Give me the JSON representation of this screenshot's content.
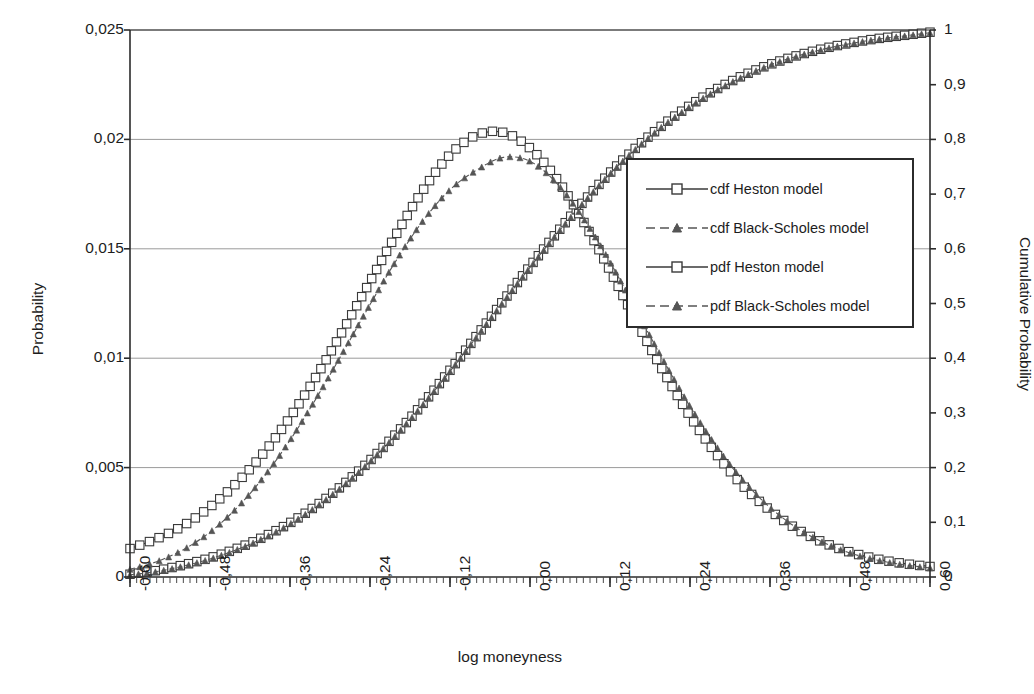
{
  "chart_data": {
    "type": "line",
    "title": "",
    "xlabel": "log moneyness",
    "ylabel": "Probability",
    "ylabel_secondary": "Cumulative Probability",
    "xlim": [
      -0.6,
      0.6
    ],
    "ylim": [
      0,
      0.025
    ],
    "ylim_secondary": [
      0,
      1
    ],
    "grid": true,
    "legend_position": "center-right",
    "x_tick_labels": [
      "-0,60",
      "-0,48",
      "-0,36",
      "-0,24",
      "-0,12",
      "0,00",
      "0,12",
      "0,24",
      "0,36",
      "0,48",
      "0,60"
    ],
    "x_tick_values": [
      -0.6,
      -0.48,
      -0.36,
      -0.24,
      -0.12,
      0.0,
      0.12,
      0.24,
      0.36,
      0.48,
      0.6
    ],
    "y_tick_labels": [
      "0",
      "0,005",
      "0,01",
      "0,015",
      "0,02",
      "0,025"
    ],
    "y_tick_values": [
      0,
      0.005,
      0.01,
      0.015,
      0.02,
      0.025
    ],
    "y2_tick_labels": [
      "0",
      "0,1",
      "0,2",
      "0,3",
      "0,4",
      "0,5",
      "0,6",
      "0,7",
      "0,8",
      "0,9",
      "1"
    ],
    "y2_tick_values": [
      0,
      0.1,
      0.2,
      0.3,
      0.4,
      0.5,
      0.6,
      0.7,
      0.8,
      0.9,
      1.0
    ],
    "series": [
      {
        "name": "cdf Heston model",
        "axis": "secondary",
        "marker": "square",
        "dash": false,
        "color": "#3a3a3a",
        "x": [
          -0.6,
          -0.56,
          -0.52,
          -0.48,
          -0.44,
          -0.4,
          -0.36,
          -0.32,
          -0.28,
          -0.24,
          -0.2,
          -0.16,
          -0.12,
          -0.08,
          -0.04,
          0.0,
          0.04,
          0.08,
          0.12,
          0.16,
          0.2,
          0.24,
          0.28,
          0.32,
          0.36,
          0.4,
          0.44,
          0.48,
          0.52,
          0.56,
          0.6
        ],
        "values": [
          0.005,
          0.012,
          0.022,
          0.035,
          0.052,
          0.073,
          0.099,
          0.131,
          0.169,
          0.213,
          0.263,
          0.318,
          0.378,
          0.441,
          0.505,
          0.568,
          0.629,
          0.686,
          0.739,
          0.786,
          0.827,
          0.862,
          0.892,
          0.917,
          0.937,
          0.953,
          0.966,
          0.976,
          0.984,
          0.99,
          0.996
        ]
      },
      {
        "name": "cdf Black-Scholes model",
        "axis": "secondary",
        "marker": "triangle",
        "dash": true,
        "color": "#555555",
        "x": [
          -0.6,
          -0.56,
          -0.52,
          -0.48,
          -0.44,
          -0.4,
          -0.36,
          -0.32,
          -0.28,
          -0.24,
          -0.2,
          -0.16,
          -0.12,
          -0.08,
          -0.04,
          0.0,
          0.04,
          0.08,
          0.12,
          0.16,
          0.2,
          0.24,
          0.28,
          0.32,
          0.36,
          0.4,
          0.44,
          0.48,
          0.52,
          0.56,
          0.6
        ],
        "values": [
          0.004,
          0.01,
          0.02,
          0.033,
          0.05,
          0.071,
          0.097,
          0.129,
          0.167,
          0.211,
          0.261,
          0.316,
          0.376,
          0.439,
          0.503,
          0.566,
          0.627,
          0.684,
          0.737,
          0.784,
          0.825,
          0.86,
          0.89,
          0.915,
          0.936,
          0.952,
          0.965,
          0.975,
          0.983,
          0.989,
          0.995
        ]
      },
      {
        "name": "pdf Heston model",
        "axis": "primary",
        "marker": "square",
        "dash": false,
        "color": "#3a3a3a",
        "x": [
          -0.6,
          -0.56,
          -0.52,
          -0.48,
          -0.44,
          -0.4,
          -0.36,
          -0.32,
          -0.28,
          -0.24,
          -0.2,
          -0.16,
          -0.12,
          -0.08,
          -0.04,
          0.0,
          0.04,
          0.08,
          0.12,
          0.16,
          0.2,
          0.24,
          0.28,
          0.32,
          0.36,
          0.4,
          0.44,
          0.48,
          0.52,
          0.56,
          0.6
        ],
        "values": [
          0.0013,
          0.00175,
          0.00235,
          0.0032,
          0.0043,
          0.00565,
          0.0073,
          0.0092,
          0.0113,
          0.0135,
          0.0157,
          0.0177,
          0.0193,
          0.0202,
          0.02032,
          0.0196,
          0.0182,
          0.01625,
          0.014,
          0.01165,
          0.0094,
          0.00735,
          0.0056,
          0.00415,
          0.00305,
          0.0022,
          0.00158,
          0.00114,
          0.00083,
          0.00062,
          0.00048
        ]
      },
      {
        "name": "pdf Black-Scholes model",
        "axis": "primary",
        "marker": "triangle",
        "dash": true,
        "color": "#555555",
        "x": [
          -0.6,
          -0.56,
          -0.52,
          -0.48,
          -0.44,
          -0.4,
          -0.36,
          -0.32,
          -0.28,
          -0.24,
          -0.2,
          -0.16,
          -0.12,
          -0.08,
          -0.04,
          0.0,
          0.04,
          0.08,
          0.12,
          0.16,
          0.2,
          0.24,
          0.28,
          0.32,
          0.36,
          0.4,
          0.44,
          0.48,
          0.52,
          0.56,
          0.6
        ],
        "values": [
          0.00035,
          0.0007,
          0.00125,
          0.00205,
          0.00315,
          0.00455,
          0.00625,
          0.0082,
          0.0103,
          0.01245,
          0.0145,
          0.0163,
          0.0177,
          0.0186,
          0.01918,
          0.019,
          0.018,
          0.0164,
          0.0144,
          0.01215,
          0.0099,
          0.0078,
          0.00595,
          0.0044,
          0.00318,
          0.00225,
          0.00158,
          0.0011,
          0.00078,
          0.00056,
          0.00042
        ]
      }
    ]
  },
  "legend": {
    "items": [
      {
        "label": "cdf Heston model",
        "marker": "square-marker",
        "dash": false
      },
      {
        "label": "cdf Black-Scholes model",
        "marker": "triangle-marker",
        "dash": true
      },
      {
        "label": "pdf Heston model",
        "marker": "square-marker",
        "dash": false
      },
      {
        "label": "pdf Black-Scholes model",
        "marker": "triangle-marker",
        "dash": true
      }
    ]
  },
  "colors": {
    "axis": "#2b2b2b",
    "grid": "#9a9a9a",
    "series_primary": "#3a3a3a",
    "series_secondary": "#555555",
    "background": "#ffffff"
  }
}
